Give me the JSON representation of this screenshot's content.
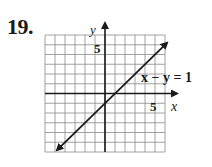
{
  "problem": {
    "number": "19."
  },
  "chart_data": {
    "type": "line",
    "title": "",
    "xlabel": "x",
    "ylabel": "y",
    "xlim": [
      -6,
      6
    ],
    "ylim": [
      -6,
      6
    ],
    "grid": true,
    "grid_step": 1,
    "tick_labels": {
      "x": [
        "5"
      ],
      "y": [
        "5"
      ]
    },
    "series": [
      {
        "name": "x − y = 1",
        "equation": "x - y = 1",
        "slope": 1,
        "intercept": -1,
        "x": [
          -4.8,
          6.2
        ],
        "y": [
          -5.8,
          5.2
        ],
        "arrows": "both"
      }
    ],
    "annotations": [
      {
        "text": "x − y = 1",
        "x": 4,
        "y": 2.3
      }
    ]
  },
  "colors": {
    "ink": "#1a1a1a",
    "grid": "#8a8a8a",
    "background": "#ffffff"
  }
}
